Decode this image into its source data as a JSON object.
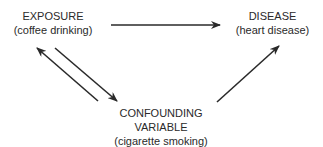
{
  "diagram": {
    "type": "causal-triangle",
    "nodes": {
      "exposure": {
        "title": "EXPOSURE",
        "subtitle": "(coffee drinking)"
      },
      "disease": {
        "title": "DISEASE",
        "subtitle": "(heart disease)"
      },
      "confounder": {
        "title_line1": "CONFOUNDING",
        "title_line2": "VARIABLE",
        "subtitle": "(cigarette smoking)"
      }
    },
    "edges": [
      {
        "from": "exposure",
        "to": "disease",
        "direction": "one-way"
      },
      {
        "from": "confounder",
        "to": "exposure",
        "direction": "one-way"
      },
      {
        "from": "exposure",
        "to": "confounder",
        "direction": "one-way"
      },
      {
        "from": "confounder",
        "to": "disease",
        "direction": "one-way"
      }
    ],
    "line_color": "#2a2a2a"
  }
}
